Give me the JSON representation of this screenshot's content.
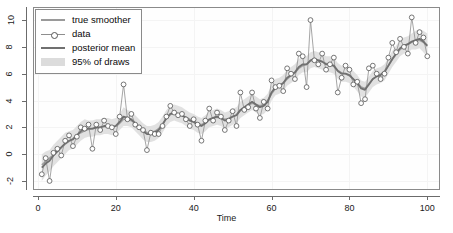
{
  "chart_data": {
    "type": "line",
    "title": "",
    "xlabel": "Time",
    "ylabel": "",
    "xlim": [
      -1,
      103
    ],
    "ylim": [
      -2.6,
      10.9
    ],
    "xticks": [
      0,
      20,
      40,
      60,
      80,
      100
    ],
    "yticks": [
      -2,
      0,
      2,
      4,
      6,
      8,
      10
    ],
    "grid": true,
    "legend": [
      {
        "label": "true smoother",
        "style": "line",
        "color": "#9a9a9a"
      },
      {
        "label": "data",
        "style": "line-marker",
        "color": "#8e8e8e"
      },
      {
        "label": "posterior mean",
        "style": "line",
        "color": "#707070"
      },
      {
        "label": "95% of draws",
        "style": "band",
        "color": "#dcdcdc"
      }
    ],
    "legend_position": "top-left",
    "x": [
      1,
      2,
      3,
      4,
      5,
      6,
      7,
      8,
      9,
      10,
      11,
      12,
      13,
      14,
      15,
      16,
      17,
      18,
      19,
      20,
      21,
      22,
      23,
      24,
      25,
      26,
      27,
      28,
      29,
      30,
      31,
      32,
      33,
      34,
      35,
      36,
      37,
      38,
      39,
      40,
      41,
      42,
      43,
      44,
      45,
      46,
      47,
      48,
      49,
      50,
      51,
      52,
      53,
      54,
      55,
      56,
      57,
      58,
      59,
      60,
      61,
      62,
      63,
      64,
      65,
      66,
      67,
      68,
      69,
      70,
      71,
      72,
      73,
      74,
      75,
      76,
      77,
      78,
      79,
      80,
      81,
      82,
      83,
      84,
      85,
      86,
      87,
      88,
      89,
      90,
      91,
      92,
      93,
      94,
      95,
      96,
      97,
      98,
      99,
      100
    ],
    "series": [
      {
        "name": "data",
        "values": [
          -1.5,
          -0.3,
          -2.0,
          0.1,
          0.4,
          -0.1,
          1.0,
          1.4,
          0.6,
          1.3,
          2.0,
          1.9,
          2.2,
          0.4,
          2.2,
          1.8,
          2.5,
          2.1,
          2.0,
          1.5,
          2.8,
          5.2,
          2.6,
          3.0,
          2.2,
          2.0,
          1.8,
          0.3,
          1.6,
          1.5,
          1.5,
          2.1,
          2.8,
          3.6,
          3.1,
          2.9,
          3.0,
          2.6,
          2.1,
          2.6,
          2.2,
          1.0,
          2.5,
          3.4,
          2.5,
          3.1,
          2.8,
          1.8,
          2.5,
          3.2,
          2.1,
          4.6,
          3.3,
          3.5,
          4.6,
          3.4,
          2.7,
          3.9,
          3.4,
          5.5,
          5.0,
          5.1,
          4.7,
          6.4,
          6.0,
          5.6,
          7.5,
          7.3,
          5.0,
          10.0,
          7.0,
          6.7,
          7.5,
          6.3,
          6.7,
          7.2,
          4.6,
          5.7,
          6.6,
          6.3,
          5.2,
          5.4,
          3.8,
          4.1,
          6.4,
          6.6,
          6.0,
          5.6,
          6.0,
          7.2,
          8.3,
          7.6,
          8.6,
          8.0,
          7.5,
          10.2,
          8.3,
          9.1,
          8.7,
          7.3
        ]
      },
      {
        "name": "posterior mean",
        "values": [
          -1.0,
          -0.7,
          -0.5,
          -0.1,
          0.2,
          0.5,
          0.8,
          1.0,
          1.1,
          1.4,
          1.7,
          1.9,
          1.9,
          1.9,
          2.0,
          2.0,
          2.1,
          2.1,
          2.0,
          2.1,
          2.4,
          2.8,
          2.7,
          2.6,
          2.3,
          2.0,
          1.7,
          1.5,
          1.5,
          1.6,
          1.8,
          2.2,
          2.7,
          3.0,
          3.1,
          3.0,
          2.9,
          2.7,
          2.5,
          2.4,
          2.2,
          2.1,
          2.3,
          2.6,
          2.7,
          2.8,
          2.7,
          2.5,
          2.6,
          2.8,
          2.9,
          3.3,
          3.5,
          3.7,
          3.9,
          3.7,
          3.5,
          3.6,
          3.9,
          4.6,
          5.0,
          5.1,
          5.3,
          5.7,
          5.9,
          6.1,
          6.5,
          6.7,
          6.7,
          7.0,
          7.1,
          7.0,
          6.9,
          6.7,
          6.7,
          6.6,
          6.2,
          6.0,
          6.0,
          5.9,
          5.6,
          5.3,
          4.9,
          4.8,
          5.2,
          5.6,
          5.8,
          5.9,
          6.1,
          6.6,
          7.1,
          7.5,
          7.9,
          8.1,
          8.2,
          8.4,
          8.5,
          8.6,
          8.4,
          8.1
        ]
      },
      {
        "name": "true smoother",
        "values": [
          -0.8,
          -0.55,
          -0.3,
          -0.05,
          0.2,
          0.5,
          0.75,
          0.95,
          1.15,
          1.4,
          1.6,
          1.75,
          1.85,
          1.9,
          1.95,
          2.0,
          2.05,
          2.05,
          2.05,
          2.1,
          2.3,
          2.6,
          2.6,
          2.5,
          2.3,
          2.05,
          1.8,
          1.6,
          1.6,
          1.7,
          1.9,
          2.25,
          2.65,
          2.95,
          3.05,
          3.0,
          2.9,
          2.75,
          2.6,
          2.45,
          2.3,
          2.2,
          2.35,
          2.55,
          2.7,
          2.75,
          2.7,
          2.6,
          2.65,
          2.8,
          2.95,
          3.25,
          3.45,
          3.65,
          3.8,
          3.7,
          3.6,
          3.7,
          4.0,
          4.5,
          4.9,
          5.1,
          5.3,
          5.6,
          5.85,
          6.05,
          6.4,
          6.6,
          6.7,
          6.95,
          7.05,
          7.0,
          6.9,
          6.75,
          6.7,
          6.55,
          6.25,
          6.05,
          6.0,
          5.85,
          5.6,
          5.35,
          5.0,
          4.9,
          5.25,
          5.6,
          5.8,
          5.95,
          6.2,
          6.6,
          7.05,
          7.45,
          7.8,
          8.05,
          8.2,
          8.35,
          8.45,
          8.5,
          8.35,
          8.05
        ]
      }
    ],
    "band": {
      "name": "95% of draws",
      "lower": [
        -2.0,
        -1.6,
        -1.3,
        -0.9,
        -0.6,
        -0.3,
        0.0,
        0.3,
        0.4,
        0.7,
        1.0,
        1.2,
        1.3,
        1.3,
        1.4,
        1.4,
        1.5,
        1.5,
        1.4,
        1.5,
        1.8,
        2.1,
        2.1,
        2.0,
        1.7,
        1.4,
        1.1,
        0.9,
        0.9,
        1.0,
        1.2,
        1.6,
        2.1,
        2.4,
        2.5,
        2.4,
        2.3,
        2.1,
        1.9,
        1.8,
        1.6,
        1.5,
        1.7,
        2.0,
        2.1,
        2.2,
        2.1,
        1.9,
        2.0,
        2.2,
        2.3,
        2.7,
        2.9,
        3.1,
        3.3,
        3.1,
        2.9,
        3.0,
        3.3,
        4.0,
        4.4,
        4.5,
        4.7,
        5.1,
        5.3,
        5.5,
        5.9,
        6.1,
        6.1,
        6.4,
        6.5,
        6.4,
        6.3,
        6.1,
        6.1,
        6.0,
        5.6,
        5.4,
        5.4,
        5.3,
        5.0,
        4.7,
        4.3,
        4.2,
        4.6,
        5.0,
        5.2,
        5.3,
        5.5,
        6.0,
        6.5,
        6.9,
        7.3,
        7.5,
        7.6,
        7.8,
        7.8,
        7.9,
        7.6,
        7.2
      ],
      "upper": [
        0.0,
        0.2,
        0.3,
        0.7,
        1.0,
        1.3,
        1.6,
        1.7,
        1.8,
        2.1,
        2.4,
        2.6,
        2.5,
        2.5,
        2.6,
        2.6,
        2.7,
        2.7,
        2.6,
        2.7,
        3.0,
        3.5,
        3.3,
        3.2,
        2.9,
        2.6,
        2.3,
        2.1,
        2.1,
        2.2,
        2.4,
        2.8,
        3.3,
        3.6,
        3.7,
        3.6,
        3.5,
        3.3,
        3.1,
        3.0,
        2.8,
        2.7,
        2.9,
        3.2,
        3.3,
        3.4,
        3.3,
        3.1,
        3.2,
        3.4,
        3.5,
        3.9,
        4.1,
        4.3,
        4.5,
        4.3,
        4.1,
        4.2,
        4.5,
        5.2,
        5.6,
        5.7,
        5.9,
        6.3,
        6.5,
        6.7,
        7.1,
        7.3,
        7.3,
        7.6,
        7.7,
        7.6,
        7.5,
        7.3,
        7.3,
        7.2,
        6.8,
        6.6,
        6.6,
        6.5,
        6.2,
        5.9,
        5.5,
        5.4,
        5.8,
        6.2,
        6.4,
        6.5,
        6.7,
        7.2,
        7.7,
        8.1,
        8.5,
        8.7,
        8.8,
        9.0,
        9.2,
        9.3,
        9.2,
        9.0
      ]
    },
    "colors": {
      "data_line": "#8e8e8e",
      "data_marker_stroke": "#555555",
      "data_marker_fill": "#ffffff",
      "posterior_mean": "#707070",
      "true_smoother": "#9a9a9a",
      "band": "#dcdcdc",
      "axis": "#6b6b6b",
      "grid": "#f4f4f4",
      "text": "#1a1a1a"
    }
  }
}
